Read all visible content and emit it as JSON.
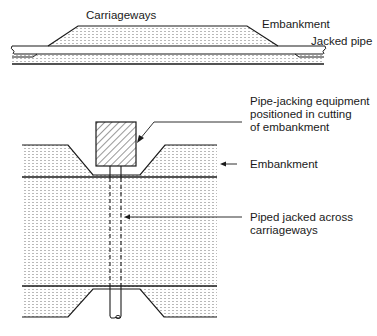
{
  "top_view": {
    "labels": {
      "carriageways": "Carriageways",
      "embankment": "Embankment",
      "jacked_pipe": "Jacked pipe"
    }
  },
  "plan_view": {
    "labels": {
      "equipment": "Pipe-jacking equipment\npositioned in cutting\nof embankment",
      "embankment": "Embankment",
      "pipe": "Piped jacked across\ncarriageways"
    }
  },
  "colors": {
    "line": "#1a1a1a",
    "hatch": "#9a9a9a",
    "background": "#ffffff"
  }
}
